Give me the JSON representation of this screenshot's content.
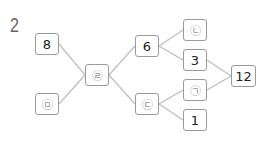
{
  "problem_number": "2",
  "nodes": [
    {
      "id": "n8",
      "label": "8",
      "x": 35,
      "y": 33,
      "circled": false
    },
    {
      "id": "nm",
      "label": "㉤",
      "x": 35,
      "y": 93,
      "circled": true
    },
    {
      "id": "nr",
      "label": "㉣",
      "x": 85,
      "y": 64,
      "circled": true
    },
    {
      "id": "n6",
      "label": "6",
      "x": 135,
      "y": 35,
      "circled": false
    },
    {
      "id": "nd",
      "label": "㉢",
      "x": 135,
      "y": 93,
      "circled": true
    },
    {
      "id": "nn",
      "label": "㉡",
      "x": 183,
      "y": 19,
      "circled": true
    },
    {
      "id": "n3",
      "label": "3",
      "x": 183,
      "y": 49,
      "circled": false
    },
    {
      "id": "ng",
      "label": "㉠",
      "x": 183,
      "y": 79,
      "circled": true
    },
    {
      "id": "n1",
      "label": "1",
      "x": 183,
      "y": 109,
      "circled": false
    },
    {
      "id": "n12",
      "label": "12",
      "x": 231,
      "y": 65,
      "circled": false
    }
  ],
  "edges": [
    [
      "n8",
      "nr"
    ],
    [
      "nm",
      "nr"
    ],
    [
      "nr",
      "n6"
    ],
    [
      "nr",
      "nd"
    ],
    [
      "n6",
      "nn"
    ],
    [
      "n6",
      "n3"
    ],
    [
      "nd",
      "ng"
    ],
    [
      "nd",
      "n1"
    ],
    [
      "n3",
      "n12"
    ],
    [
      "ng",
      "n12"
    ]
  ],
  "colors": {
    "line": "#bdbdbd",
    "border": "#9a9a9a"
  }
}
